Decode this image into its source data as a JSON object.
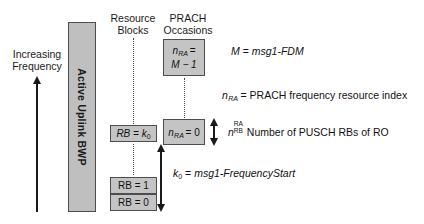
{
  "diagram": {
    "axis": {
      "label": "Increasing\nFrequency",
      "direction": "up"
    },
    "bwp": {
      "label": "Active Uplink BWP",
      "fill_color": "#bfbfbf",
      "border_color": "#4d4d4d"
    },
    "columns": [
      {
        "id": "resource-blocks",
        "label": "Resource\nBlocks"
      },
      {
        "id": "prach-occasions",
        "label": "PRACH\nOccasions"
      }
    ],
    "resource_blocks": [
      {
        "id": "rb-k0",
        "label": "RB = k",
        "sub": "0"
      },
      {
        "id": "rb-1",
        "label": "RB = 1",
        "sub": ""
      },
      {
        "id": "rb-0",
        "label": "RB = 0",
        "sub": ""
      }
    ],
    "prach_occasions": [
      {
        "id": "ro-m-minus-1",
        "line1_var": "n",
        "line1_sub": "RA",
        "line1_eq": "=",
        "line2": "M − 1"
      },
      {
        "id": "ro-0",
        "line1_var": "n",
        "line1_sub": "RA",
        "line1_eq": "= 0",
        "line2": ""
      }
    ],
    "legend": [
      {
        "id": "legend-m",
        "var": "M",
        "eq": "=",
        "value": "msg1-FDM"
      },
      {
        "id": "legend-nra",
        "var": "n",
        "var_sub": "RA",
        "eq": "=",
        "value": "PRACH frequency resource index"
      },
      {
        "id": "legend-nrb-ra",
        "var": "n",
        "sup": "RA",
        "sub": "RB",
        "value": "Number of PUSCH RBs of RO"
      },
      {
        "id": "legend-k0",
        "var": "k",
        "var_sub": "0",
        "eq": "=",
        "value": "msg1-FrequencyStart"
      }
    ],
    "measures": [
      {
        "id": "nrb-ra-extent",
        "kind": "double-arrow",
        "orientation": "vertical"
      },
      {
        "id": "k0-offset",
        "kind": "double-arrow",
        "orientation": "vertical",
        "label_var": "k",
        "label_sub": "0"
      }
    ],
    "colors": {
      "box_fill": "#c4c4c4",
      "bar_fill": "#bfbfbf",
      "stroke": "#4d4d4d",
      "text": "#111111",
      "dotted": "#4a4a4a"
    }
  }
}
